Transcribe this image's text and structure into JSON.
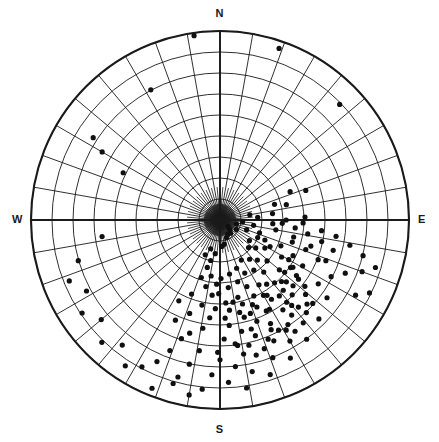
{
  "figure": {
    "width": 439,
    "height": 442,
    "background": "#ffffff",
    "stroke_color": "#1a1a1a",
    "point_color": "#101010"
  },
  "labels": {
    "north": "N",
    "east": "E",
    "south": "S",
    "west": "W"
  },
  "caption": {
    "truncated_text": ""
  },
  "chart_data": {
    "type": "scatter",
    "projection": "stereographic-polar-equal-area",
    "title": "",
    "subtitle": "",
    "xlabel": "",
    "ylabel": "",
    "grid": true,
    "legend": null,
    "center_px": [
      220,
      220
    ],
    "radius_px": 189,
    "azimuth_labels": [
      "N",
      "E",
      "S",
      "W"
    ],
    "azimuth_label_degrees": [
      0,
      90,
      180,
      270
    ],
    "radial_rings_degrees": [
      10,
      20,
      30,
      40,
      50,
      60,
      70,
      80,
      90
    ],
    "radial_spokes_degrees_step": 10,
    "primitive_ring_degrees": 90,
    "rlim": [
      0,
      90
    ],
    "r_units": "degrees from center (plunge 90 at center, 0 at primitive)",
    "annotations": [],
    "n_points": 190,
    "point_marker": "filled-circle",
    "point_radius_px": 2.6,
    "points_note": "Each point is a pole/lineation plotted as [azimuth_degrees, radius_fraction_of_primitive]; strong concentration in the SSE-ESE sector.",
    "points": [
      [
        352,
        0.985
      ],
      [
        332,
        0.78
      ],
      [
        19,
        0.96
      ],
      [
        46,
        0.88
      ],
      [
        296,
        0.57
      ],
      [
        300,
        0.72
      ],
      [
        303,
        0.8
      ],
      [
        262,
        0.63
      ],
      [
        129,
        0.055
      ],
      [
        134,
        0.07
      ],
      [
        141,
        0.09
      ],
      [
        151,
        0.085
      ],
      [
        120,
        0.1
      ],
      [
        160,
        0.1
      ],
      [
        170,
        0.13
      ],
      [
        176,
        0.14
      ],
      [
        95,
        0.12
      ],
      [
        99,
        0.18
      ],
      [
        104,
        0.09
      ],
      [
        110,
        0.15
      ],
      [
        115,
        0.22
      ],
      [
        118,
        0.3
      ],
      [
        122,
        0.28
      ],
      [
        125,
        0.19
      ],
      [
        128,
        0.24
      ],
      [
        131,
        0.33
      ],
      [
        134,
        0.21
      ],
      [
        137,
        0.29
      ],
      [
        140,
        0.36
      ],
      [
        143,
        0.26
      ],
      [
        146,
        0.32
      ],
      [
        149,
        0.4
      ],
      [
        152,
        0.24
      ],
      [
        155,
        0.31
      ],
      [
        158,
        0.38
      ],
      [
        161,
        0.27
      ],
      [
        164,
        0.34
      ],
      [
        167,
        0.42
      ],
      [
        170,
        0.29
      ],
      [
        173,
        0.36
      ],
      [
        176,
        0.44
      ],
      [
        179,
        0.31
      ],
      [
        181,
        0.39
      ],
      [
        183,
        0.47
      ],
      [
        113,
        0.35
      ],
      [
        116,
        0.43
      ],
      [
        119,
        0.5
      ],
      [
        121,
        0.38
      ],
      [
        124,
        0.45
      ],
      [
        127,
        0.52
      ],
      [
        130,
        0.41
      ],
      [
        133,
        0.48
      ],
      [
        136,
        0.55
      ],
      [
        139,
        0.44
      ],
      [
        142,
        0.51
      ],
      [
        145,
        0.58
      ],
      [
        148,
        0.47
      ],
      [
        151,
        0.54
      ],
      [
        154,
        0.61
      ],
      [
        157,
        0.5
      ],
      [
        160,
        0.57
      ],
      [
        163,
        0.64
      ],
      [
        166,
        0.53
      ],
      [
        169,
        0.6
      ],
      [
        172,
        0.67
      ],
      [
        175,
        0.56
      ],
      [
        178,
        0.63
      ],
      [
        181,
        0.7
      ],
      [
        100,
        0.3
      ],
      [
        103,
        0.4
      ],
      [
        106,
        0.5
      ],
      [
        108,
        0.22
      ],
      [
        111,
        0.6
      ],
      [
        114,
        0.26
      ],
      [
        117,
        0.66
      ],
      [
        123,
        0.62
      ],
      [
        126,
        0.7
      ],
      [
        132,
        0.66
      ],
      [
        135,
        0.74
      ],
      [
        138,
        0.62
      ],
      [
        141,
        0.7
      ],
      [
        144,
        0.78
      ],
      [
        147,
        0.66
      ],
      [
        150,
        0.74
      ],
      [
        153,
        0.82
      ],
      [
        156,
        0.7
      ],
      [
        159,
        0.78
      ],
      [
        162,
        0.86
      ],
      [
        165,
        0.74
      ],
      [
        168,
        0.82
      ],
      [
        171,
        0.9
      ],
      [
        174,
        0.78
      ],
      [
        177,
        0.86
      ],
      [
        180,
        0.74
      ],
      [
        183,
        0.82
      ],
      [
        186,
        0.9
      ],
      [
        189,
        0.7
      ],
      [
        192,
        0.78
      ],
      [
        195,
        0.86
      ],
      [
        198,
        0.66
      ],
      [
        201,
        0.74
      ],
      [
        204,
        0.82
      ],
      [
        186,
        0.52
      ],
      [
        189,
        0.58
      ],
      [
        192,
        0.46
      ],
      [
        195,
        0.62
      ],
      [
        198,
        0.52
      ],
      [
        201,
        0.42
      ],
      [
        204,
        0.58
      ],
      [
        207,
        0.48
      ],
      [
        183,
        0.34
      ],
      [
        186,
        0.4
      ],
      [
        189,
        0.3
      ],
      [
        192,
        0.36
      ],
      [
        195,
        0.26
      ],
      [
        198,
        0.32
      ],
      [
        90,
        0.35
      ],
      [
        92,
        0.44
      ],
      [
        94,
        0.28
      ],
      [
        96,
        0.54
      ],
      [
        98,
        0.62
      ],
      [
        101,
        0.7
      ],
      [
        104,
        0.78
      ],
      [
        107,
        0.86
      ],
      [
        110,
        0.8
      ],
      [
        113,
        0.72
      ],
      [
        116,
        0.88
      ],
      [
        119,
        0.82
      ],
      [
        107,
        0.4
      ],
      [
        109,
        0.48
      ],
      [
        112,
        0.56
      ],
      [
        105,
        0.62
      ],
      [
        102,
        0.55
      ],
      [
        99,
        0.47
      ],
      [
        96,
        0.4
      ],
      [
        93,
        0.33
      ],
      [
        128,
        0.57
      ],
      [
        131,
        0.6
      ],
      [
        134,
        0.64
      ],
      [
        137,
        0.67
      ],
      [
        140,
        0.59
      ],
      [
        143,
        0.63
      ],
      [
        146,
        0.71
      ],
      [
        149,
        0.68
      ],
      [
        152,
        0.66
      ],
      [
        155,
        0.64
      ],
      [
        158,
        0.68
      ],
      [
        161,
        0.72
      ],
      [
        164,
        0.6
      ],
      [
        167,
        0.68
      ],
      [
        170,
        0.72
      ],
      [
        173,
        0.66
      ],
      [
        120,
        0.42
      ],
      [
        123,
        0.46
      ],
      [
        126,
        0.5
      ],
      [
        129,
        0.44
      ],
      [
        132,
        0.52
      ],
      [
        135,
        0.46
      ],
      [
        138,
        0.5
      ],
      [
        141,
        0.56
      ],
      [
        144,
        0.42
      ],
      [
        147,
        0.5
      ],
      [
        150,
        0.46
      ],
      [
        153,
        0.54
      ],
      [
        156,
        0.44
      ],
      [
        159,
        0.48
      ],
      [
        162,
        0.52
      ],
      [
        165,
        0.46
      ],
      [
        168,
        0.5
      ],
      [
        171,
        0.44
      ],
      [
        174,
        0.48
      ],
      [
        177,
        0.52
      ],
      [
        190,
        0.94
      ],
      [
        196,
        0.9
      ],
      [
        202,
        0.96
      ],
      [
        208,
        0.88
      ],
      [
        213,
        0.92
      ],
      [
        218,
        0.84
      ],
      [
        224,
        0.9
      ],
      [
        230,
        0.82
      ],
      [
        236,
        0.88
      ],
      [
        242,
        0.8
      ],
      [
        248,
        0.86
      ],
      [
        254,
        0.78
      ],
      [
        188,
        0.18
      ],
      [
        193,
        0.22
      ],
      [
        198,
        0.16
      ],
      [
        203,
        0.2
      ],
      [
        86,
        0.2
      ],
      [
        83,
        0.28
      ],
      [
        80,
        0.16
      ],
      [
        88,
        0.45
      ],
      [
        77,
        0.36
      ],
      [
        74,
        0.3
      ],
      [
        71,
        0.48
      ],
      [
        68,
        0.4
      ]
    ]
  }
}
